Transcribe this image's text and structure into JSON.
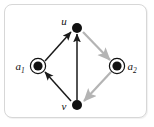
{
  "figure": {
    "kind": "directed-graph-diagram",
    "frame": {
      "border_color": "#d7d7d7",
      "background_color": "#ffffff",
      "corner_radius": 8
    },
    "palette": {
      "node_fill": "#111111",
      "node_ring": "#111111",
      "edge_black": "#1a1a1a",
      "edge_gray": "#b4b4b4",
      "label_color": "#121212"
    }
  },
  "nodes": [
    {
      "id": "u",
      "label": "u",
      "subscript": "",
      "style": "filled",
      "x": 77,
      "y": 28,
      "radius": 5,
      "label_x": 64,
      "label_y": 25,
      "label_anchor": "middle"
    },
    {
      "id": "a1",
      "label": "a",
      "subscript": "1",
      "style": "filled-ringed",
      "x": 38,
      "y": 66,
      "radius": 4.6,
      "ring_radius": 7.6,
      "label_x": 20,
      "label_y": 70,
      "label_anchor": "middle"
    },
    {
      "id": "a2",
      "label": "a",
      "subscript": "2",
      "style": "filled-ringed",
      "x": 117,
      "y": 66,
      "radius": 4.6,
      "ring_radius": 7.6,
      "label_x": 132,
      "label_y": 70,
      "label_anchor": "middle"
    },
    {
      "id": "v",
      "label": "v",
      "subscript": "",
      "style": "filled",
      "x": 77,
      "y": 105,
      "radius": 5,
      "label_x": 64,
      "label_y": 110,
      "label_anchor": "middle"
    }
  ],
  "edges": [
    {
      "id": "a1-to-u",
      "from": "a1",
      "to": "u",
      "color": "black",
      "arrow": "to",
      "x1": 45,
      "y1": 61,
      "x2": 71,
      "y2": 32
    },
    {
      "id": "u-to-a2",
      "from": "u",
      "to": "a2",
      "color": "gray",
      "arrow": "to",
      "x1": 83,
      "y1": 32,
      "x2": 110,
      "y2": 60
    },
    {
      "id": "a2-to-v",
      "from": "a2",
      "to": "v",
      "color": "gray",
      "arrow": "to",
      "x1": 111,
      "y1": 72,
      "x2": 84,
      "y2": 101
    },
    {
      "id": "v-to-a1",
      "from": "v",
      "to": "a1",
      "color": "black",
      "arrow": "to",
      "x1": 71,
      "y1": 101,
      "x2": 45,
      "y2": 72
    },
    {
      "id": "v-to-u",
      "from": "v",
      "to": "u",
      "color": "black",
      "arrow": "to",
      "x1": 77,
      "y1": 100,
      "x2": 77,
      "y2": 34
    }
  ]
}
